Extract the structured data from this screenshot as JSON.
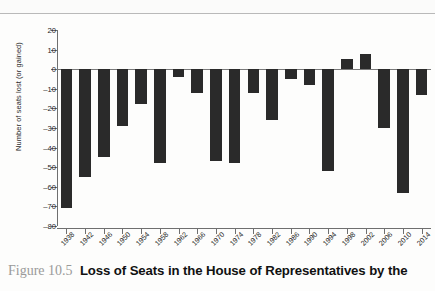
{
  "figure": {
    "caption_number": "Figure 10.5",
    "caption_title": "Loss of Seats in the House of Representatives by the"
  },
  "chart_data": {
    "type": "bar",
    "title": "",
    "xlabel": "",
    "ylabel": "Number of seats lost (or gained)",
    "ylim": [
      -80,
      20
    ],
    "yticks": [
      20,
      10,
      0,
      -10,
      -20,
      -30,
      -40,
      -50,
      -60,
      -70,
      -80
    ],
    "ytick_labels": [
      "20",
      "10",
      "0",
      "–10",
      "–20",
      "–30",
      "–40",
      "–50",
      "–60",
      "–70",
      "–80"
    ],
    "grid": false,
    "legend": false,
    "categories": [
      "1938",
      "1942",
      "1946",
      "1950",
      "1954",
      "1958",
      "1962",
      "1966",
      "1970",
      "1974",
      "1978",
      "1982",
      "1986",
      "1990",
      "1994",
      "1998",
      "2002",
      "2006",
      "2010",
      "2014"
    ],
    "values": [
      -71,
      -55,
      -45,
      -29,
      -18,
      -48,
      -4,
      -12,
      -47,
      -48,
      -12,
      -26,
      -5,
      -8,
      -52,
      5,
      8,
      -30,
      -63,
      -13
    ]
  }
}
